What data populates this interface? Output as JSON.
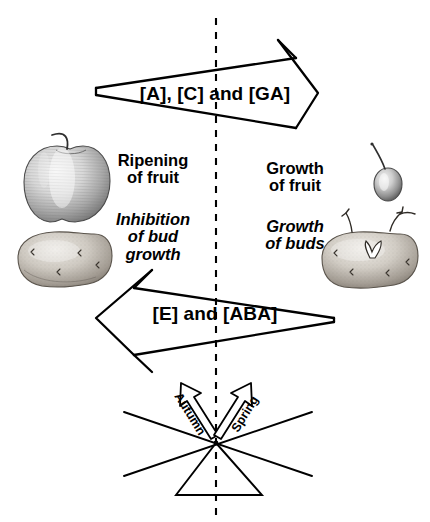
{
  "figure": {
    "background_color": "#ffffff",
    "stroke_color": "#000000",
    "width": 430,
    "height": 522
  },
  "center_divider": {
    "name": "dashed-midline",
    "style": "dashed vertical line",
    "x": 216,
    "y_start": 18,
    "y_end": 522
  },
  "arrows": {
    "upper": {
      "label": "[A], [C] and [GA]",
      "direction": "right",
      "hormones": [
        "[A]",
        "[C]",
        "[GA]"
      ],
      "meaning": "Auxin, Cytokinin and Gibberellin"
    },
    "lower": {
      "label": "[E] and [ABA]",
      "direction": "left",
      "hormones": [
        "[E]",
        "[ABA]"
      ],
      "meaning": "Ethylene and Abscisic acid"
    }
  },
  "left_column": {
    "process_primary": "Ripening\nof fruit",
    "process_secondary": "Inhibition\nof bud\ngrowth",
    "illustrations": [
      {
        "name": "apple-fruit-illustration",
        "caption": "ripe apple"
      },
      {
        "name": "dormant-potato-illustration",
        "caption": "potato tuber with dormant buds"
      }
    ]
  },
  "right_column": {
    "process_primary": "Growth\nof fruit",
    "process_secondary": "Growth\nof buds",
    "illustrations": [
      {
        "name": "young-fruitlet-illustration",
        "caption": "small young fruit"
      },
      {
        "name": "sprouting-potato-illustration",
        "caption": "potato tuber with sprouting buds"
      }
    ]
  },
  "seesaw": {
    "name": "balance-seesaw",
    "fulcrum": {
      "name": "triangle-fulcrum",
      "apex_x": 216,
      "apex_y": 443,
      "base_y": 495,
      "base_left_x": 176,
      "base_right_x": 262
    },
    "beams": [
      {
        "name": "beam-left-down",
        "from_x": 124,
        "from_y": 412,
        "to_x": 312,
        "to_y": 476
      },
      {
        "name": "beam-right-down",
        "from_x": 124,
        "from_y": 476,
        "to_x": 312,
        "to_y": 412
      }
    ],
    "season_arrows": [
      {
        "name": "autumn-arrow",
        "label": "Autumn",
        "direction": "up-left",
        "angle_deg": 58
      },
      {
        "name": "spring-arrow",
        "label": "Spring",
        "direction": "up-right",
        "angle_deg": -58
      }
    ]
  }
}
